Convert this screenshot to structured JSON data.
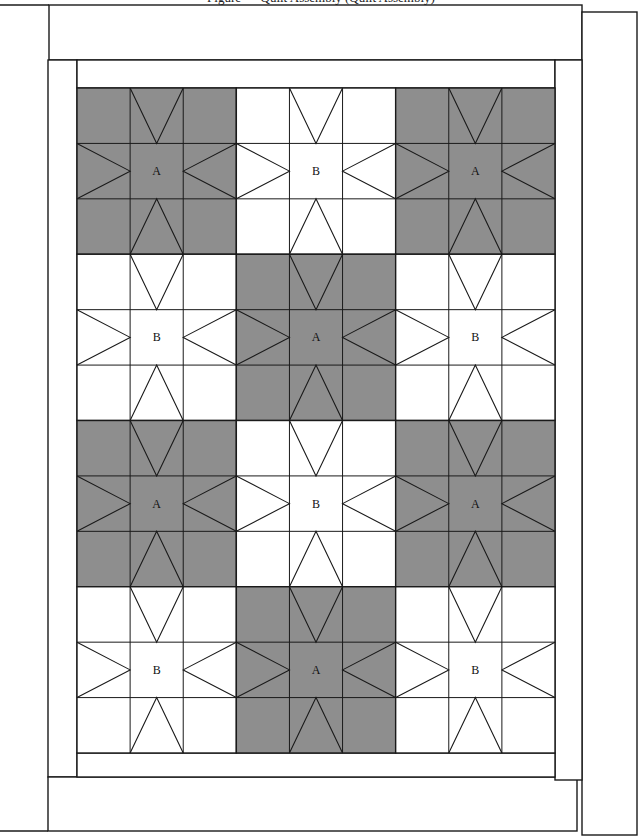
{
  "caption": "Figure — Quilt Assembly (Quilt Assembly)",
  "colors": {
    "block_a_fill": "#8e8e8e",
    "block_b_fill": "#ffffff",
    "line": "#1a1a1a",
    "background": "#ffffff"
  },
  "quilt": {
    "columns": 3,
    "rows": 4,
    "grid": {
      "x": 77,
      "y": 88,
      "width": 478,
      "height": 665
    },
    "blocks": [
      [
        "A",
        "B",
        "A"
      ],
      [
        "B",
        "A",
        "B"
      ],
      [
        "A",
        "B",
        "A"
      ],
      [
        "B",
        "A",
        "B"
      ]
    ],
    "block_types": {
      "A": {
        "label": "A",
        "fill": "#8e8e8e"
      },
      "B": {
        "label": "B",
        "fill": "#ffffff"
      }
    }
  },
  "borders": {
    "top_outer": {
      "x": 49,
      "y": 5,
      "w": 533,
      "h": 55
    },
    "right_outer": {
      "x": 582,
      "y": 12,
      "w": 55,
      "h": 823
    },
    "left_outer": {
      "x": 48,
      "y": 60,
      "w": 29,
      "h": 717
    },
    "bottom_outer": {
      "x": 48,
      "y": 777,
      "w": 529,
      "h": 54
    },
    "top_inner": {
      "x": 77,
      "y": 60,
      "w": 478,
      "h": 28
    },
    "right_inner": {
      "x": 555,
      "y": 60,
      "w": 27,
      "h": 720
    },
    "bottom_inner": {
      "x": 77,
      "y": 753,
      "w": 478,
      "h": 24
    }
  },
  "page_rules": {
    "top": {
      "x1": 0,
      "y1": 5,
      "x2": 49,
      "y2": 5
    },
    "bottom": {
      "x1": 0,
      "y1": 831,
      "x2": 48,
      "y2": 831
    }
  }
}
